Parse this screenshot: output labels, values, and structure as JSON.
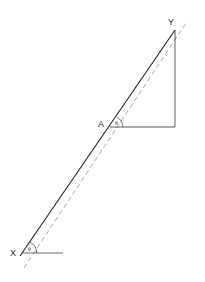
{
  "diagram": {
    "type": "geometry",
    "points": {
      "X": {
        "label": "X",
        "x": 22,
        "y": 253
      },
      "A": {
        "label": "A",
        "x": 110,
        "y": 127
      },
      "Y": {
        "label": "Y",
        "x": 175,
        "y": 30
      }
    },
    "angles": {
      "at_X": {
        "label": "θ"
      },
      "at_A": {
        "label": "θ"
      }
    },
    "colors": {
      "line": "#222222",
      "dashed": "#888888",
      "background": "#ffffff"
    }
  }
}
